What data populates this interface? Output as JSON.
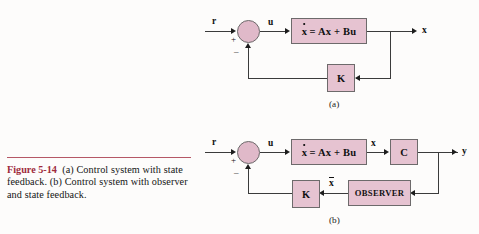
{
  "figure": {
    "label": "Figure 5-14",
    "caption": "(a) Control system with state feedback. (b) Control system with observer and state feedback.",
    "rule_color": "#a8394b",
    "label_color": "#9e2a3c"
  },
  "palette": {
    "box_fill": "#e6c3d1",
    "circle_fill": "#e0b9c9",
    "box_stroke": "#6d6a6b",
    "line": "#3b3b3b",
    "text": "#101010",
    "page_bg": "#fdfcfb"
  },
  "diagrams": [
    {
      "id": "a",
      "subcaption": "(a)",
      "blocks": [
        {
          "id": "plant-a",
          "text": "x = Ax + Bu",
          "kind": "equation"
        },
        {
          "id": "gain-k-a",
          "text": "K",
          "kind": "gain"
        }
      ],
      "summing_junction": {
        "id": "sum-a",
        "plus": "+",
        "minus": "–"
      },
      "signals": [
        {
          "id": "ref-a",
          "label": "r"
        },
        {
          "id": "ctrl-a",
          "label": "u"
        },
        {
          "id": "state-a",
          "label": "x"
        }
      ]
    },
    {
      "id": "b",
      "subcaption": "(b)",
      "blocks": [
        {
          "id": "plant-b",
          "text": "x = Ax + Bu",
          "kind": "equation"
        },
        {
          "id": "output-c-b",
          "text": "C",
          "kind": "gain"
        },
        {
          "id": "gain-k-b",
          "text": "K",
          "kind": "gain"
        },
        {
          "id": "observer-b",
          "text": "OBSERVER",
          "kind": "observer"
        }
      ],
      "summing_junction": {
        "id": "sum-b",
        "plus": "+",
        "minus": "–"
      },
      "signals": [
        {
          "id": "ref-b",
          "label": "r"
        },
        {
          "id": "ctrl-b",
          "label": "u"
        },
        {
          "id": "state-b",
          "label": "x"
        },
        {
          "id": "output-b",
          "label": "y"
        },
        {
          "id": "estimate-b",
          "label": "x"
        }
      ]
    }
  ]
}
